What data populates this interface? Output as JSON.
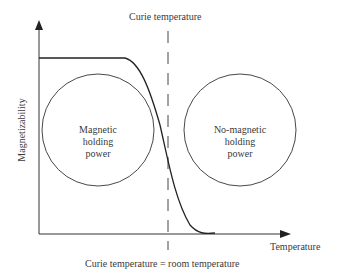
{
  "diagram": {
    "top_label": "Curie temperature",
    "bottom_label": "Curie temperature = room temperature",
    "x_axis_label": "Temperature",
    "y_axis_label": "Magnetizability",
    "left_circle": {
      "line1": "Magnetic",
      "line2": "holding",
      "line3": "power"
    },
    "right_circle": {
      "line1": "No-magnetic",
      "line2": "holding",
      "line3": "power"
    },
    "colors": {
      "line": "#2a2a2a",
      "text": "#3a3a3a",
      "background": "#ffffff"
    }
  }
}
